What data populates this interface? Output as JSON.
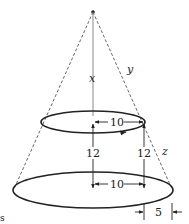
{
  "diagram": {
    "type": "frustum-of-cone",
    "labels": {
      "x": "x",
      "y": "y",
      "z": "z",
      "top_radius": "10",
      "bottom_radius": "10",
      "height_center": "12",
      "height_right": "12",
      "offset": "5",
      "corner_mark": "s"
    },
    "colors": {
      "line": "#222222",
      "dashed": "#555555",
      "axis": "#888888"
    }
  }
}
